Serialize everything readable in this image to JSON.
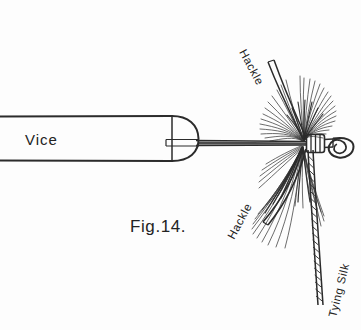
{
  "figure": {
    "caption": "Fig.14.",
    "background_color": "#fdfdfd",
    "ink_color": "#2b2b2b"
  },
  "labels": {
    "vice": "Vice",
    "hackle_top": "Hackle",
    "hackle_bottom": "Hackle",
    "tying_silk": "Tying Silk"
  },
  "parts": {
    "vice_body_name": "vice-body",
    "vice_jaw_name": "vice-jaw-cap",
    "hook_shank_name": "hook-shank",
    "hook_eye_name": "hook-eye",
    "head_wraps_name": "thread-head-wraps",
    "hackle_upper_name": "hackle-feather-upper",
    "hackle_lower_name": "hackle-feather-lower",
    "silk_name": "tying-silk-strand"
  }
}
